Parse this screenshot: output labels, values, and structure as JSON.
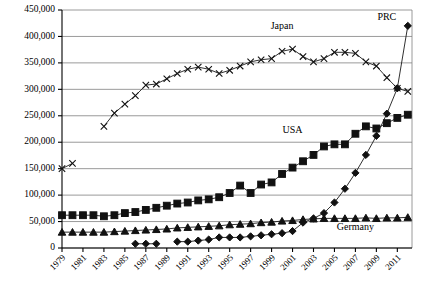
{
  "chart_data": {
    "type": "line",
    "title": "",
    "xlabel": "",
    "ylabel": "",
    "ylim": [
      0,
      450000
    ],
    "ytick_step": 50000,
    "grid": true,
    "legend": "inline-labels",
    "ytick_labels": [
      "0",
      "50,000",
      "100,000",
      "150,000",
      "200,000",
      "250,000",
      "300,000",
      "350,000",
      "400,000",
      "450,000"
    ],
    "ytick_values": [
      0,
      50000,
      100000,
      150000,
      200000,
      250000,
      300000,
      350000,
      400000,
      450000
    ],
    "x": [
      1979,
      1980,
      1981,
      1982,
      1983,
      1984,
      1985,
      1986,
      1987,
      1988,
      1989,
      1990,
      1991,
      1992,
      1993,
      1994,
      1995,
      1996,
      1997,
      1998,
      1999,
      2000,
      2001,
      2002,
      2003,
      2004,
      2005,
      2006,
      2007,
      2008,
      2009,
      2010,
      2011,
      2012
    ],
    "xtick_labels": [
      "1979",
      "1981",
      "1983",
      "1985",
      "1987",
      "1989",
      "1991",
      "1993",
      "1995",
      "1997",
      "1999",
      "2001",
      "2003",
      "2005",
      "2007",
      "2009",
      "2011"
    ],
    "xtick_values": [
      1979,
      1981,
      1983,
      1985,
      1987,
      1989,
      1991,
      1993,
      1995,
      1997,
      1999,
      2001,
      2003,
      2005,
      2007,
      2009,
      2011
    ],
    "series": [
      {
        "name": "Japan",
        "marker": "x",
        "label_x": 2000,
        "label_y": 415000,
        "points": [
          [
            1979,
            150000
          ],
          [
            1980,
            160000
          ],
          [
            1983,
            230000
          ],
          [
            1984,
            255000
          ],
          [
            1985,
            272000
          ],
          [
            1986,
            288000
          ],
          [
            1987,
            308000
          ],
          [
            1988,
            310000
          ],
          [
            1989,
            320000
          ],
          [
            1990,
            330000
          ],
          [
            1991,
            338000
          ],
          [
            1992,
            342000
          ],
          [
            1993,
            338000
          ],
          [
            1994,
            330000
          ],
          [
            1995,
            336000
          ],
          [
            1996,
            344000
          ],
          [
            1997,
            352000
          ],
          [
            1998,
            356000
          ],
          [
            1999,
            358000
          ],
          [
            2000,
            372000
          ],
          [
            2001,
            376000
          ],
          [
            2002,
            362000
          ],
          [
            2003,
            352000
          ],
          [
            2004,
            358000
          ],
          [
            2005,
            370000
          ],
          [
            2006,
            370000
          ],
          [
            2007,
            368000
          ],
          [
            2008,
            352000
          ],
          [
            2009,
            344000
          ],
          [
            2010,
            322000
          ],
          [
            2011,
            302000
          ],
          [
            2012,
            296000
          ]
        ]
      },
      {
        "name": "USA",
        "marker": "square",
        "label_x": 2001,
        "label_y": 218000,
        "points": [
          [
            1979,
            62000
          ],
          [
            1980,
            62000
          ],
          [
            1981,
            62000
          ],
          [
            1982,
            62000
          ],
          [
            1983,
            60000
          ],
          [
            1984,
            62000
          ],
          [
            1985,
            66000
          ],
          [
            1986,
            68000
          ],
          [
            1987,
            72000
          ],
          [
            1988,
            76000
          ],
          [
            1989,
            80000
          ],
          [
            1990,
            84000
          ],
          [
            1991,
            86000
          ],
          [
            1992,
            90000
          ],
          [
            1993,
            92000
          ],
          [
            1994,
            96000
          ],
          [
            1995,
            104000
          ],
          [
            1996,
            118000
          ],
          [
            1997,
            104000
          ],
          [
            1998,
            120000
          ],
          [
            1999,
            124000
          ],
          [
            2000,
            140000
          ],
          [
            2001,
            152000
          ],
          [
            2002,
            164000
          ],
          [
            2003,
            176000
          ],
          [
            2004,
            192000
          ],
          [
            2005,
            196000
          ],
          [
            2006,
            196000
          ],
          [
            2007,
            216000
          ],
          [
            2008,
            230000
          ],
          [
            2009,
            226000
          ],
          [
            2010,
            236000
          ],
          [
            2011,
            246000
          ],
          [
            2012,
            252000
          ]
        ]
      },
      {
        "name": "PRC",
        "marker": "diamond",
        "label_x": 2010,
        "label_y": 432000,
        "points": [
          [
            1986,
            8000
          ],
          [
            1987,
            8000
          ],
          [
            1988,
            8000
          ],
          [
            1990,
            12000
          ],
          [
            1991,
            12000
          ],
          [
            1992,
            14000
          ],
          [
            1993,
            16000
          ],
          [
            1994,
            20000
          ],
          [
            1995,
            20000
          ],
          [
            1996,
            20000
          ],
          [
            1997,
            22000
          ],
          [
            1998,
            24000
          ],
          [
            1999,
            26000
          ],
          [
            2000,
            28000
          ],
          [
            2001,
            32000
          ],
          [
            2002,
            48000
          ],
          [
            2003,
            56000
          ],
          [
            2004,
            66000
          ],
          [
            2005,
            86000
          ],
          [
            2006,
            112000
          ],
          [
            2007,
            142000
          ],
          [
            2008,
            176000
          ],
          [
            2009,
            212000
          ],
          [
            2010,
            254000
          ],
          [
            2011,
            302000
          ],
          [
            2012,
            420000
          ]
        ]
      },
      {
        "name": "Germany",
        "marker": "triangle",
        "label_x": 2007,
        "label_y": 34000,
        "points": [
          [
            1979,
            30000
          ],
          [
            1980,
            30000
          ],
          [
            1981,
            30000
          ],
          [
            1982,
            30000
          ],
          [
            1983,
            30000
          ],
          [
            1984,
            31000
          ],
          [
            1985,
            32000
          ],
          [
            1986,
            33000
          ],
          [
            1987,
            34000
          ],
          [
            1988,
            35000
          ],
          [
            1989,
            36000
          ],
          [
            1990,
            38000
          ],
          [
            1991,
            39000
          ],
          [
            1992,
            40000
          ],
          [
            1993,
            41000
          ],
          [
            1994,
            42000
          ],
          [
            1995,
            44000
          ],
          [
            1996,
            45000
          ],
          [
            1997,
            46000
          ],
          [
            1998,
            48000
          ],
          [
            1999,
            49000
          ],
          [
            2000,
            51000
          ],
          [
            2001,
            52000
          ],
          [
            2002,
            54000
          ],
          [
            2003,
            55000
          ],
          [
            2004,
            56000
          ],
          [
            2005,
            56000
          ],
          [
            2006,
            56000
          ],
          [
            2007,
            56000
          ],
          [
            2008,
            57000
          ],
          [
            2009,
            56000
          ],
          [
            2010,
            57000
          ],
          [
            2011,
            57000
          ],
          [
            2012,
            58000
          ]
        ]
      }
    ]
  }
}
